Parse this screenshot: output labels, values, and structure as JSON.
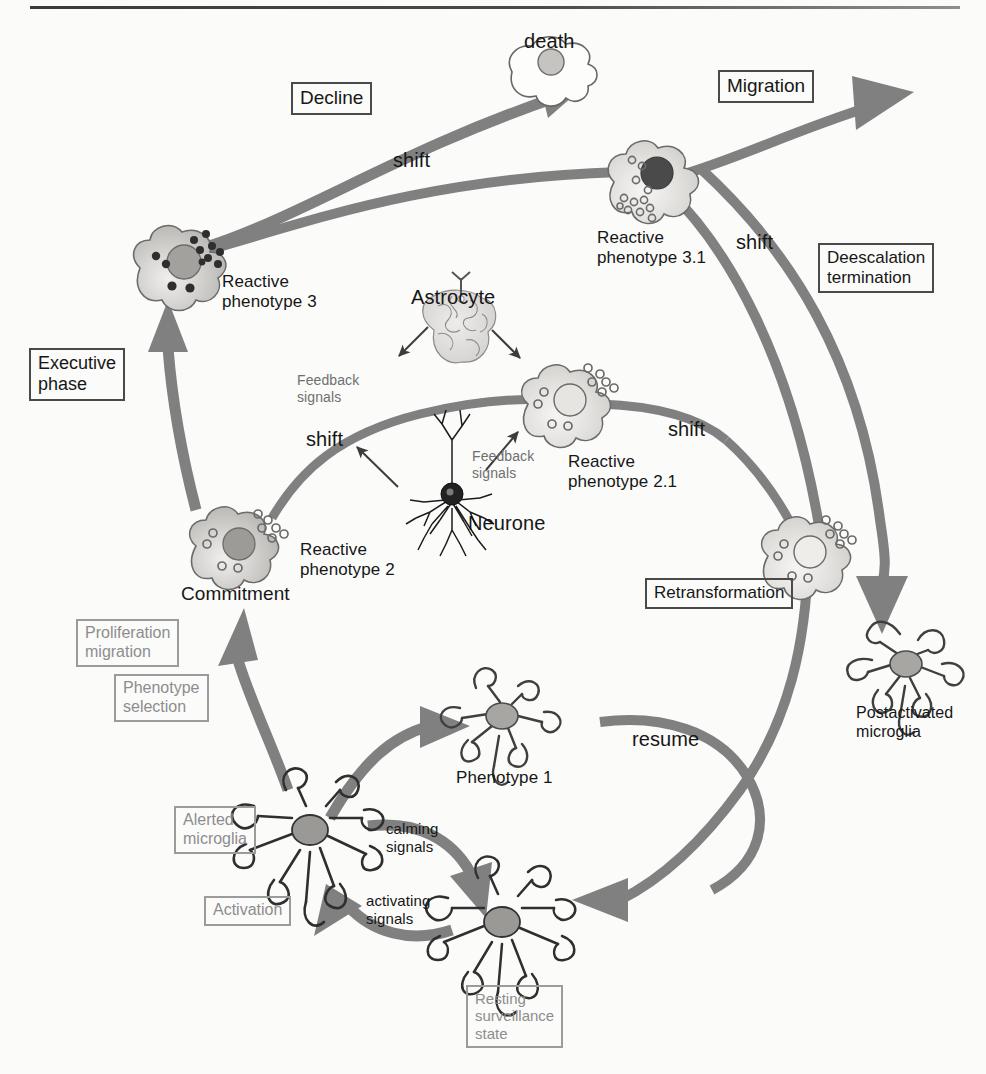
{
  "figure": {
    "top_rule": true,
    "background_color": "#fbfbfa",
    "arrow_color": "#808080",
    "text_color": "#1a1a1a",
    "faded_text_color": "#8d8d8d"
  },
  "phase_boxes": [
    {
      "id": "decline",
      "label": "Decline",
      "style": "solid"
    },
    {
      "id": "migration",
      "label": "Migration",
      "style": "solid"
    },
    {
      "id": "deescalation",
      "label": "Deescalation\ntermination",
      "style": "solid"
    },
    {
      "id": "executive",
      "label": "Executive\nphase",
      "style": "solid"
    },
    {
      "id": "retransform",
      "label": "Retransformation",
      "style": "solid"
    },
    {
      "id": "proliferation",
      "label": "Proliferation\nmigration",
      "style": "faded"
    },
    {
      "id": "phenoselect",
      "label": "Phenotype\nselection",
      "style": "faded"
    },
    {
      "id": "alerted",
      "label": "Alerted\nmicroglia",
      "style": "faded"
    },
    {
      "id": "activation",
      "label": "Activation",
      "style": "faded"
    },
    {
      "id": "resting",
      "label": "Resting\nsurveillance\nstate",
      "style": "faded"
    }
  ],
  "cell_labels": [
    {
      "id": "death",
      "label": "death"
    },
    {
      "id": "reactive3",
      "label": "Reactive\nphenotype 3"
    },
    {
      "id": "reactive31",
      "label": "Reactive\nphenotype 3.1"
    },
    {
      "id": "reactive2",
      "label": "Reactive\nphenotype 2"
    },
    {
      "id": "reactive21",
      "label": "Reactive\nphenotype 2.1"
    },
    {
      "id": "commitment",
      "label": "Commitment"
    },
    {
      "id": "astrocyte",
      "label": "Astrocyte"
    },
    {
      "id": "neurone",
      "label": "Neurone"
    },
    {
      "id": "postactivated",
      "label": "Postactivated\nmicroglia"
    },
    {
      "id": "phenotype1",
      "label": "Phenotype 1"
    }
  ],
  "transition_labels": [
    {
      "id": "shift-top",
      "label": "shift"
    },
    {
      "id": "shift-right",
      "label": "shift"
    },
    {
      "id": "shift-mid-left",
      "label": "shift"
    },
    {
      "id": "shift-mid-right",
      "label": "shift"
    },
    {
      "id": "resume",
      "label": "resume"
    }
  ],
  "signal_labels": [
    {
      "id": "feedback-astro",
      "label": "Feedback\nsignals",
      "tone": "grey"
    },
    {
      "id": "feedback-neurone",
      "label": "Feedback\nsignals",
      "tone": "grey"
    },
    {
      "id": "calming",
      "label": "calming\nsignals",
      "tone": "dark"
    },
    {
      "id": "activating",
      "label": "activating\nsignals",
      "tone": "dark"
    }
  ],
  "bleed_through": {
    "line1": "ghosted text from reverse page",
    "line2": "ghosted text from reverse page",
    "line3": "ghosted text from reverse page"
  }
}
